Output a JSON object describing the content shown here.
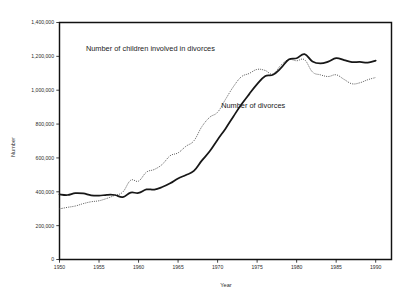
{
  "chart_data": {
    "type": "line",
    "title": "",
    "xlabel": "Year",
    "ylabel": "Number",
    "xlim": [
      1950,
      1992
    ],
    "ylim": [
      0,
      1400000
    ],
    "grid": false,
    "legend_position": "inline-annotation",
    "x_ticks": [
      "1950",
      "1955",
      "1960",
      "1965",
      "1970",
      "1975",
      "1980",
      "1985",
      "1990"
    ],
    "x_tick_values": [
      1950,
      1955,
      1960,
      1965,
      1970,
      1975,
      1980,
      1985,
      1990
    ],
    "y_ticks": [
      "0",
      "200,000",
      "400,000",
      "600,000",
      "800,000",
      "1,000,000",
      "1,200,000",
      "1,400,000"
    ],
    "y_tick_values": [
      0,
      200000,
      400000,
      600000,
      800000,
      1000000,
      1200000,
      1400000
    ],
    "x": [
      1950,
      1951,
      1952,
      1953,
      1954,
      1955,
      1956,
      1957,
      1958,
      1959,
      1960,
      1961,
      1962,
      1963,
      1964,
      1965,
      1966,
      1967,
      1968,
      1969,
      1970,
      1971,
      1972,
      1973,
      1974,
      1975,
      1976,
      1977,
      1978,
      1979,
      1980,
      1981,
      1982,
      1983,
      1984,
      1985,
      1986,
      1987,
      1988,
      1989,
      1990
    ],
    "series": [
      {
        "name": "Number of divorces",
        "style": "solid",
        "color": "#171717",
        "label_x": 1974,
        "label_y": 890000,
        "values": [
          385000,
          381000,
          392000,
          390000,
          379000,
          377000,
          382000,
          381000,
          368000,
          395000,
          393000,
          414000,
          413000,
          428000,
          450000,
          479000,
          499000,
          523000,
          584000,
          639000,
          708000,
          773000,
          845000,
          915000,
          977000,
          1036000,
          1083000,
          1091000,
          1130000,
          1181000,
          1189000,
          1213000,
          1170000,
          1158000,
          1169000,
          1190000,
          1178000,
          1166000,
          1167000,
          1163000,
          1175000
        ]
      },
      {
        "name": "Number of children involved in divorces",
        "style": "dotted",
        "color": "#5d5d5d",
        "label_x": 1962,
        "label_y": 1228000,
        "values": [
          299000,
          308000,
          316000,
          330000,
          341000,
          347000,
          361000,
          379000,
          398000,
          468000,
          463000,
          516000,
          532000,
          562000,
          613000,
          630000,
          669000,
          701000,
          784000,
          840000,
          870000,
          946000,
          1021000,
          1079000,
          1099000,
          1123000,
          1117000,
          1095000,
          1147000,
          1181000,
          1174000,
          1180000,
          1108000,
          1091000,
          1081000,
          1091000,
          1064000,
          1038000,
          1044000,
          1062000,
          1075000
        ]
      }
    ],
    "annotations": [
      {
        "text": "Number of children involved in divorces",
        "x": 1961.5,
        "y": 1232000
      },
      {
        "text": "Number of divorces",
        "x": 1974.5,
        "y": 893000
      }
    ]
  },
  "axis": {
    "x_title": "Year",
    "y_title": "Number"
  }
}
